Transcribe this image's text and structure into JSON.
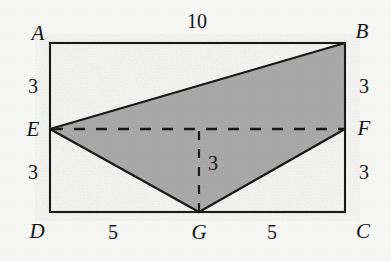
{
  "figure": {
    "type": "geometry-diagram",
    "background_color": "#f7f7f6",
    "stroke_color": "#1a1a1a",
    "shade_color": "#a9a9a9",
    "rectangle": {
      "left": 50,
      "top": 43,
      "right": 345,
      "bottom": 212
    },
    "points": {
      "A": {
        "x": 50,
        "y": 43
      },
      "B": {
        "x": 345,
        "y": 43
      },
      "C": {
        "x": 345,
        "y": 212
      },
      "D": {
        "x": 50,
        "y": 212
      },
      "E": {
        "x": 50,
        "y": 129
      },
      "F": {
        "x": 345,
        "y": 129
      },
      "G": {
        "x": 199,
        "y": 212
      }
    },
    "shaded_polygon": "E,B,F,G",
    "solid_segments": [
      "A-B",
      "B-C",
      "C-D",
      "D-A",
      "E-B",
      "E-G",
      "G-F"
    ],
    "dashed_segments": [
      "E-F",
      "G-up-to-EF"
    ]
  },
  "labels": {
    "vertices": [
      {
        "name": "vertex-label-A",
        "text": "A",
        "x": 38,
        "y": 33
      },
      {
        "name": "vertex-label-B",
        "text": "B",
        "x": 362,
        "y": 31
      },
      {
        "name": "vertex-label-C",
        "text": "C",
        "x": 363,
        "y": 231
      },
      {
        "name": "vertex-label-D",
        "text": "D",
        "x": 37,
        "y": 231
      },
      {
        "name": "vertex-label-E",
        "text": "E",
        "x": 33,
        "y": 129
      },
      {
        "name": "vertex-label-F",
        "text": "F",
        "x": 364,
        "y": 128
      },
      {
        "name": "vertex-label-G",
        "text": "G",
        "x": 199,
        "y": 232
      }
    ],
    "measures": [
      {
        "name": "measure-label-top-AB",
        "text": "10",
        "x": 197,
        "y": 21
      },
      {
        "name": "measure-label-left-AE",
        "text": "3",
        "x": 33,
        "y": 86
      },
      {
        "name": "measure-label-left-ED",
        "text": "3",
        "x": 33,
        "y": 172
      },
      {
        "name": "measure-label-right-BF",
        "text": "3",
        "x": 364,
        "y": 86
      },
      {
        "name": "measure-label-right-FC",
        "text": "3",
        "x": 364,
        "y": 172
      },
      {
        "name": "measure-label-height-GH",
        "text": "3",
        "x": 213,
        "y": 163
      },
      {
        "name": "measure-label-bottom-DG",
        "text": "5",
        "x": 113,
        "y": 232
      },
      {
        "name": "measure-label-bottom-GC",
        "text": "5",
        "x": 272,
        "y": 232
      }
    ]
  }
}
